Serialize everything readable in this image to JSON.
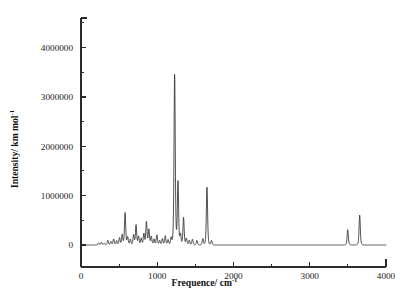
{
  "figure": {
    "background_color": "#ffffff",
    "line_color": "#333333",
    "axis_color": "#2b2b2b"
  },
  "axes": {
    "x_title_main": "Frequence/ cm",
    "x_title_sup": "-1",
    "y_title_main": "Intensity/ km mol",
    "y_title_sup": "-1"
  },
  "chart_data": {
    "type": "line",
    "title": "",
    "xlabel": "Frequence/ cm-1",
    "ylabel": "Intensity/ km mol-1",
    "xlim": [
      0,
      4000
    ],
    "ylim": [
      -250000,
      4600000
    ],
    "grid": false,
    "legend": null,
    "x_ticks_major": [
      0,
      1000,
      2000,
      3000,
      4000
    ],
    "x_tick_labels": [
      "0",
      "1000",
      "2000",
      "3000",
      "4000"
    ],
    "x_ticks_minor": [
      500,
      1500,
      2500,
      3500
    ],
    "y_ticks_major": [
      0,
      1000000,
      2000000,
      3000000,
      4000000
    ],
    "y_tick_labels": [
      "0",
      "1000000",
      "2000000",
      "3000000",
      "4000000"
    ],
    "y_ticks_minor": [
      500000,
      1500000,
      2500000,
      3500000,
      4500000
    ],
    "baseline": 0,
    "peak_width": 11,
    "series": [
      {
        "name": "IR intensity",
        "peaks": [
          {
            "x": 230,
            "y": 42000
          },
          {
            "x": 268,
            "y": 58000
          },
          {
            "x": 305,
            "y": 35000
          },
          {
            "x": 352,
            "y": 96000
          },
          {
            "x": 392,
            "y": 70000
          },
          {
            "x": 428,
            "y": 120000
          },
          {
            "x": 468,
            "y": 88000
          },
          {
            "x": 505,
            "y": 150000
          },
          {
            "x": 540,
            "y": 210000
          },
          {
            "x": 578,
            "y": 660000
          },
          {
            "x": 612,
            "y": 160000
          },
          {
            "x": 648,
            "y": 118000
          },
          {
            "x": 690,
            "y": 205000
          },
          {
            "x": 722,
            "y": 410000
          },
          {
            "x": 755,
            "y": 175000
          },
          {
            "x": 790,
            "y": 140000
          },
          {
            "x": 825,
            "y": 232000
          },
          {
            "x": 858,
            "y": 470000
          },
          {
            "x": 890,
            "y": 318000
          },
          {
            "x": 922,
            "y": 175000
          },
          {
            "x": 958,
            "y": 120000
          },
          {
            "x": 995,
            "y": 205000
          },
          {
            "x": 1032,
            "y": 92000
          },
          {
            "x": 1068,
            "y": 128000
          },
          {
            "x": 1105,
            "y": 188000
          },
          {
            "x": 1142,
            "y": 110000
          },
          {
            "x": 1182,
            "y": 150000
          },
          {
            "x": 1228,
            "y": 3480000
          },
          {
            "x": 1272,
            "y": 1280000
          },
          {
            "x": 1305,
            "y": 215000
          },
          {
            "x": 1345,
            "y": 560000
          },
          {
            "x": 1382,
            "y": 135000
          },
          {
            "x": 1420,
            "y": 98000
          },
          {
            "x": 1462,
            "y": 118000
          },
          {
            "x": 1520,
            "y": 95000
          },
          {
            "x": 1598,
            "y": 130000
          },
          {
            "x": 1652,
            "y": 1180000
          },
          {
            "x": 1712,
            "y": 92000
          },
          {
            "x": 3498,
            "y": 310000
          },
          {
            "x": 3655,
            "y": 610000
          }
        ]
      }
    ]
  }
}
